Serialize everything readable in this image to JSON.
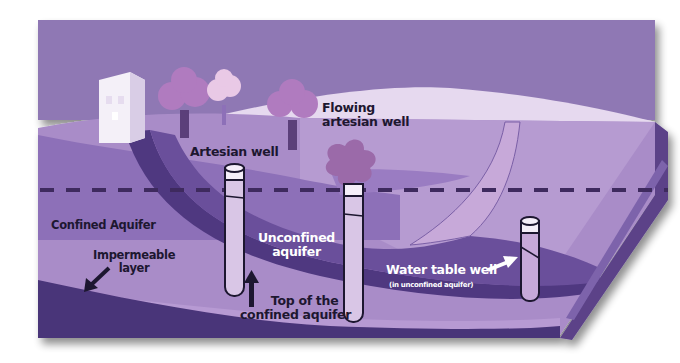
{
  "diagram": {
    "colors": {
      "sky": "#8f78b4",
      "hill_light": "#e6d9ef",
      "land_surface": "#a98cc8",
      "land_dark": "#7a5fa6",
      "confined_aquifer": "#b79ad3",
      "impermeable_layer": "#4a3479",
      "unconfined_aquifer": "#6a4f9b",
      "recharge_band": "#c7a9d9",
      "building": "#f4f0f8",
      "tree_canopy": "#b07bbf",
      "tree_canopy_light": "#e9c9e6",
      "tree_trunk": "#5b3f7a",
      "water_table_dash": "#3e2a5e",
      "well_fill": "#d9c6e6",
      "well_cap": "#f5eef9",
      "text_dark": "#1d1730",
      "text_light": "#ffffff"
    },
    "labels": {
      "flowing_artesian_well": [
        "Flowing",
        "artesian well"
      ],
      "artesian_well": "Artesian well",
      "confined_aquifer": "Confined Aquifer",
      "impermeable_layer": [
        "Impermeable",
        "layer"
      ],
      "unconfined_aquifer": [
        "Unconfined",
        "aquifer"
      ],
      "top_of_confined_aquifer": [
        "Top of the",
        "confined aquifer"
      ],
      "water_table_well": "Water table well",
      "water_table_well_note": "(in unconfined aquifer)"
    },
    "icons": [
      "building-icon",
      "tree-icon",
      "well-icon",
      "arrow-icon",
      "water-table-dashed-line"
    ]
  }
}
